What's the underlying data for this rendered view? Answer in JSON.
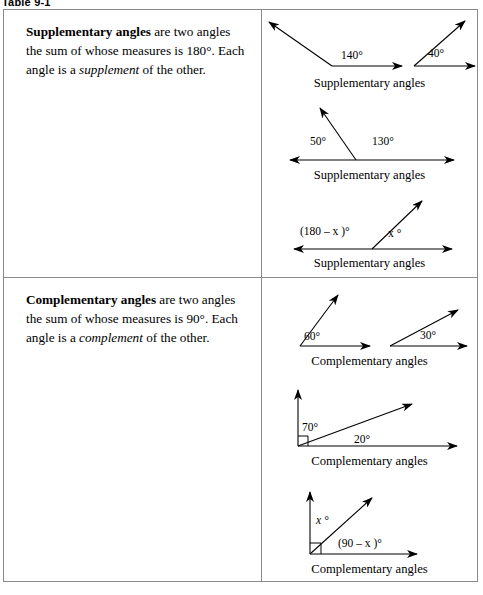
{
  "caption": "Table 9-1",
  "rows": [
    {
      "id": "supplementary",
      "description": {
        "term": "Supplementary angles",
        "mid": " are two angles the sum of whose measures is 180°. Each angle is a ",
        "emph": "supplement",
        "tail": " of the other."
      },
      "figures": [
        {
          "caption": "Supplementary angles",
          "labels": {
            "left": "140°",
            "right": "40°"
          }
        },
        {
          "caption": "Supplementary angles",
          "labels": {
            "left": "50°",
            "right": "130°"
          }
        },
        {
          "caption": "Supplementary angles",
          "labels": {
            "left": "(180 – x )°",
            "left_var": "x",
            "right": "x °"
          }
        }
      ]
    },
    {
      "id": "complementary",
      "description": {
        "term": "Complementary angles",
        "mid": " are two angles the sum of whose measures is 90°. Each angle is a ",
        "emph": "complement",
        "tail": " of the other."
      },
      "figures": [
        {
          "caption": "Complementary angles",
          "labels": {
            "left": "60°",
            "right": "30°"
          }
        },
        {
          "caption": "Complementary angles",
          "labels": {
            "left": "70°",
            "right": "20°"
          }
        },
        {
          "caption": "Complementary angles",
          "labels": {
            "left": "x °",
            "right": "(90 – x )°"
          }
        }
      ]
    }
  ],
  "colors": {
    "ink": "#000000",
    "border": "#8a8a8a",
    "background": "#ffffff"
  }
}
